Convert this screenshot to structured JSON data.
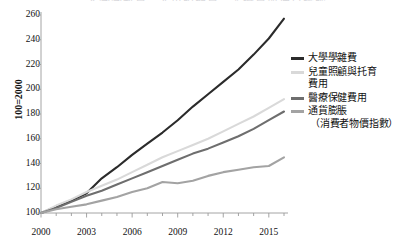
{
  "title": "大學學雜費、兒童照顧費、醫療費與通貨膨脹",
  "axes": {
    "y_label": "100=2000",
    "y_ticks": [
      100,
      120,
      140,
      160,
      180,
      200,
      220,
      240,
      260
    ],
    "x_ticks": [
      2000,
      2003,
      2006,
      2009,
      2012,
      2015
    ]
  },
  "legend": {
    "items": [
      {
        "label": "大學學雜費",
        "label_line2": "",
        "color": "#2b2b2b"
      },
      {
        "label": "兒童照顧與托育",
        "label_line2": "費用",
        "color": "#d9d9d9"
      },
      {
        "label": "醫療保健費用",
        "label_line2": "",
        "color": "#6e6e6e"
      },
      {
        "label": "通貨膨脹",
        "label_line2": "（消費者物價指數）",
        "color": "#a3a3a3"
      }
    ]
  },
  "chart_data": {
    "type": "line",
    "title": "大學學雜費、兒童照顧費、醫療費與通貨膨脹",
    "xlabel": "",
    "ylabel": "100=2000",
    "xlim": [
      2000,
      2016
    ],
    "ylim": [
      100,
      260
    ],
    "grid": false,
    "legend_position": "right",
    "x": [
      2000,
      2001,
      2002,
      2003,
      2004,
      2005,
      2006,
      2007,
      2008,
      2009,
      2010,
      2011,
      2012,
      2013,
      2014,
      2015,
      2016
    ],
    "series": [
      {
        "name": "大學學雜費",
        "color": "#2b2b2b",
        "values": [
          100,
          105,
          110,
          116,
          128,
          137,
          147,
          156,
          165,
          175,
          186,
          196,
          206,
          216,
          228,
          241,
          257
        ]
      },
      {
        "name": "兒童照顧與托育費用",
        "color": "#d9d9d9",
        "values": [
          100,
          106,
          111,
          117,
          122,
          127,
          133,
          139,
          145,
          150,
          155,
          160,
          166,
          172,
          178,
          185,
          192
        ]
      },
      {
        "name": "醫療保健費用",
        "color": "#6e6e6e",
        "values": [
          100,
          104,
          109,
          114,
          118,
          123,
          128,
          133,
          138,
          143,
          148,
          152,
          157,
          162,
          168,
          175,
          182
        ]
      },
      {
        "name": "通貨膨脹（消費者物價指數）",
        "color": "#a3a3a3",
        "values": [
          100,
          103,
          105,
          107,
          110,
          113,
          117,
          120,
          125,
          124,
          126,
          130,
          133,
          135,
          137,
          138,
          145
        ]
      }
    ]
  }
}
